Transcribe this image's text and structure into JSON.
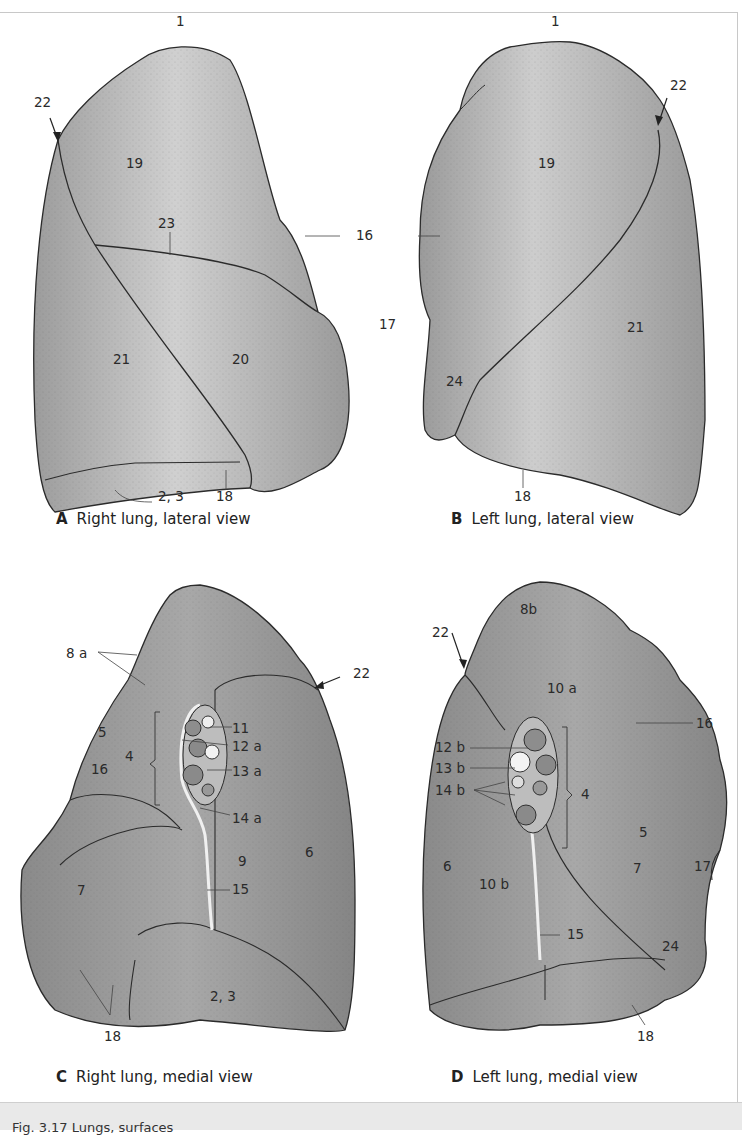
{
  "figure": {
    "footer_caption": "Fig. 3.17 Lungs, surfaces",
    "panels": [
      {
        "id": "A",
        "letter": "A",
        "title": "Right lung, lateral view",
        "labels": [
          "1",
          "22",
          "19",
          "23",
          "16",
          "21",
          "20",
          "2, 3",
          "18"
        ]
      },
      {
        "id": "B",
        "letter": "B",
        "title": "Left lung, lateral view",
        "labels": [
          "1",
          "22",
          "19",
          "16",
          "17",
          "21",
          "24",
          "18"
        ]
      },
      {
        "id": "C",
        "letter": "C",
        "title": "Right lung, medial view",
        "labels": [
          "8 a",
          "22",
          "5",
          "16",
          "4",
          "11",
          "12 a",
          "13 a",
          "14 a",
          "9",
          "6",
          "7",
          "15",
          "2, 3",
          "18"
        ]
      },
      {
        "id": "D",
        "letter": "D",
        "title": "Left lung, medial view",
        "labels": [
          "8b",
          "22",
          "10 a",
          "16",
          "12 b",
          "13 b",
          "14 b",
          "4",
          "5",
          "6",
          "10 b",
          "7",
          "17",
          "15",
          "24",
          "18"
        ]
      }
    ]
  },
  "colors": {
    "lung_fill": "#a9a9a9",
    "lung_highlight": "#d2d2d2",
    "outline": "#2b2b2b",
    "footer_bg": "#e9e9e9"
  }
}
